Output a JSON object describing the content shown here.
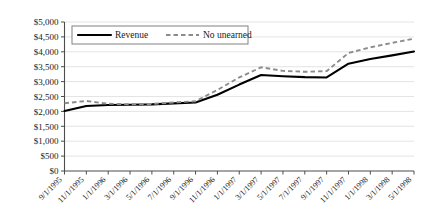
{
  "chart_data": {
    "type": "line",
    "title": "",
    "xlabel": "",
    "ylabel": "",
    "ylim": [
      0,
      5000
    ],
    "grid": true,
    "legend_position": "top-left-inside",
    "ytick_labels": [
      "$0",
      "$500",
      "$1,000",
      "$1,500",
      "$2,000",
      "$2,500",
      "$3,000",
      "$3,500",
      "$4,000",
      "$4,500",
      "$5,000"
    ],
    "ytick_values": [
      0,
      500,
      1000,
      1500,
      2000,
      2500,
      3000,
      3500,
      4000,
      4500,
      5000
    ],
    "categories": [
      "9/1/1995",
      "11/1/1995",
      "1/1/1996",
      "3/1/1996",
      "5/1/1996",
      "7/1/1996",
      "9/1/1996",
      "11/1/1996",
      "1/1/1997",
      "3/1/1997",
      "5/1/1997",
      "7/1/1997",
      "9/1/1997",
      "11/1/1997",
      "1/1/1998",
      "3/1/1998",
      "5/1/1998"
    ],
    "series": [
      {
        "name": "Revenue",
        "style": "solid",
        "color": "#000000",
        "values": [
          2010,
          2180,
          2215,
          2225,
          2235,
          2270,
          2300,
          2560,
          2900,
          3220,
          3180,
          3150,
          3140,
          3600,
          3760,
          3880,
          4010
        ]
      },
      {
        "name": "No unearned",
        "style": "dashed",
        "color": "#8c8c8c",
        "values": [
          2275,
          2350,
          2255,
          2240,
          2250,
          2300,
          2340,
          2720,
          3140,
          3480,
          3360,
          3330,
          3350,
          3960,
          4150,
          4300,
          4440
        ]
      }
    ]
  },
  "legend": {
    "items": [
      {
        "label": "Revenue"
      },
      {
        "label": "No unearned"
      }
    ]
  },
  "colors": {
    "revenue": "#000000",
    "no_unearned": "#8c8c8c",
    "grid": "#d9d9d9",
    "axis": "#4d4d4d",
    "background": "#ffffff"
  }
}
